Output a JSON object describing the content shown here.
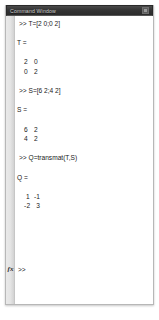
{
  "window": {
    "title": "Command Window",
    "minimize_icon": "window-button-icon"
  },
  "console": {
    "lines": [
      {
        "type": "cmd",
        "text": ">> T=[2 0;0 2]"
      },
      {
        "type": "blank",
        "text": ""
      },
      {
        "type": "varname",
        "text": "T ="
      },
      {
        "type": "blank",
        "text": ""
      },
      {
        "type": "matrow",
        "text": "2   0"
      },
      {
        "type": "matrow",
        "text": "0   2"
      },
      {
        "type": "blank",
        "text": ""
      },
      {
        "type": "cmd",
        "text": ">> S=[6 2;4 2]"
      },
      {
        "type": "blank",
        "text": ""
      },
      {
        "type": "varname",
        "text": "S ="
      },
      {
        "type": "blank",
        "text": ""
      },
      {
        "type": "matrow",
        "text": "6   2"
      },
      {
        "type": "matrow",
        "text": "4   2"
      },
      {
        "type": "blank",
        "text": ""
      },
      {
        "type": "cmd",
        "text": ">> Q=transmat(T,S)"
      },
      {
        "type": "blank",
        "text": ""
      },
      {
        "type": "varname",
        "text": "Q ="
      },
      {
        "type": "blank",
        "text": ""
      },
      {
        "type": "matrow",
        "text": " 1  -1"
      },
      {
        "type": "matrow",
        "text": "-2   3"
      }
    ],
    "fx_label": "fx",
    "prompt": ">>",
    "input_value": ""
  }
}
